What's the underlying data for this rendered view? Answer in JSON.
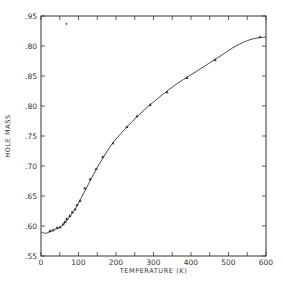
{
  "chart_data": {
    "type": "scatter",
    "title": "",
    "xlabel": "TEMPERATURE (K)",
    "ylabel": "HOLE MASS",
    "xlim": [
      0,
      600
    ],
    "ylim": [
      0.55,
      0.95
    ],
    "grid": false,
    "legend": null,
    "x_ticks": [
      0,
      100,
      200,
      300,
      400,
      500,
      600
    ],
    "x_tick_labels": [
      "0",
      "100",
      "200",
      "300",
      "400",
      "500",
      "600"
    ],
    "x_minor_ticks": [
      50,
      150,
      250,
      350,
      450,
      550
    ],
    "y_ticks": [
      0.55,
      0.6,
      0.65,
      0.7,
      0.75,
      0.8,
      0.85,
      0.9,
      0.95
    ],
    "y_tick_labels": [
      ".55",
      ".60",
      ".65",
      ".70",
      ".75",
      ".80",
      ".85",
      ".80",
      ".95"
    ],
    "series": [
      {
        "name": "measured",
        "kind": "points",
        "x": [
          24,
          32,
          43,
          51,
          59,
          64,
          69,
          77,
          83,
          91,
          96,
          104,
          117,
          131,
          147,
          165,
          192,
          229,
          256,
          291,
          336,
          389,
          464,
          584
        ],
        "y": [
          0.592,
          0.593,
          0.597,
          0.598,
          0.603,
          0.607,
          0.612,
          0.617,
          0.623,
          0.628,
          0.635,
          0.642,
          0.663,
          0.678,
          0.695,
          0.715,
          0.738,
          0.765,
          0.783,
          0.802,
          0.823,
          0.847,
          0.877,
          0.915
        ]
      },
      {
        "name": "fit",
        "kind": "line",
        "x": [
          0,
          10,
          20,
          30,
          40,
          50,
          60,
          70,
          80,
          90,
          100,
          120,
          140,
          160,
          180,
          200,
          240,
          280,
          320,
          360,
          400,
          440,
          480,
          520,
          560,
          600
        ],
        "y": [
          0.59,
          0.588,
          0.589,
          0.592,
          0.595,
          0.598,
          0.602,
          0.61,
          0.618,
          0.627,
          0.638,
          0.662,
          0.686,
          0.708,
          0.728,
          0.745,
          0.772,
          0.796,
          0.817,
          0.836,
          0.852,
          0.868,
          0.884,
          0.9,
          0.911,
          0.915
        ]
      }
    ],
    "annotations": [
      {
        "type": "stray-mark",
        "x": 68,
        "y": 0.937
      }
    ]
  },
  "colors": {
    "ink": "#333333",
    "background": "#ffffff"
  }
}
